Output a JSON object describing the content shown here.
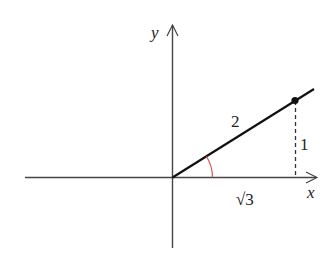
{
  "diagram": {
    "type": "trig-reference-triangle",
    "axes": {
      "x_label": "x",
      "y_label": "y"
    },
    "segment": {
      "hypotenuse_label": "2",
      "opposite_label": "1",
      "adjacent_label": "√3"
    },
    "point": {
      "coords": "(√3, 1)"
    },
    "angle": {
      "marker_color": "#d9534f"
    },
    "colors": {
      "axis": "#444444",
      "line": "#111111",
      "dashed": "#333333",
      "angle_arc": "#d9534f",
      "text": "#222222"
    }
  }
}
